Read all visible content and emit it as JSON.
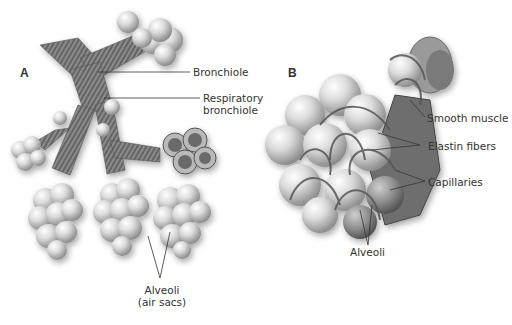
{
  "figure": {
    "panel_a": {
      "letter": "A",
      "labels": {
        "bronchiole": "Bronchiole",
        "respiratory_bronchiole_line1": "Respiratory",
        "respiratory_bronchiole_line2": "bronchiole",
        "alveoli_line1": "Alveoli",
        "alveoli_line2": "(air sacs)"
      }
    },
    "panel_b": {
      "letter": "B",
      "labels": {
        "smooth_muscle": "Smooth muscle",
        "elastin_fibers": "Elastin fibers",
        "capillaries": "Capillaries",
        "alveoli": "Alveoli"
      }
    },
    "colors": {
      "sphere_light": "#f4f4f4",
      "sphere_dark": "#9a9a9a",
      "tube": "#7a7a7a",
      "fiber": "#5a5a5a",
      "label_text": "#333333",
      "leader_line": "#333333"
    }
  }
}
